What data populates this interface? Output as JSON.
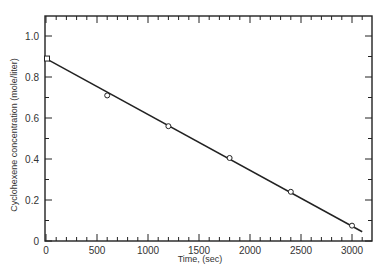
{
  "chart_data": {
    "type": "scatter",
    "title": "",
    "xlabel": "Time, (sec)",
    "ylabel": "Cyclohexene concentration (mole/liter)",
    "xlim": [
      0,
      3200
    ],
    "ylim": [
      0,
      1.1
    ],
    "x_ticks": [
      "0",
      "500",
      "1000",
      "1500",
      "2000",
      "2500",
      "3000"
    ],
    "y_ticks": [
      "0",
      "0.2",
      "0.4",
      "0.6",
      "0.8",
      "1.0"
    ],
    "grid": false,
    "legend": null,
    "series": [
      {
        "name": "data points",
        "marker": "open-circle",
        "x": [
          0,
          600,
          1200,
          1800,
          2400,
          3000
        ],
        "y": [
          0.89,
          0.71,
          0.56,
          0.405,
          0.24,
          0.075
        ]
      },
      {
        "name": "linear fit",
        "type": "line",
        "x": [
          0,
          3100
        ],
        "y": [
          0.89,
          0.045
        ]
      }
    ]
  }
}
